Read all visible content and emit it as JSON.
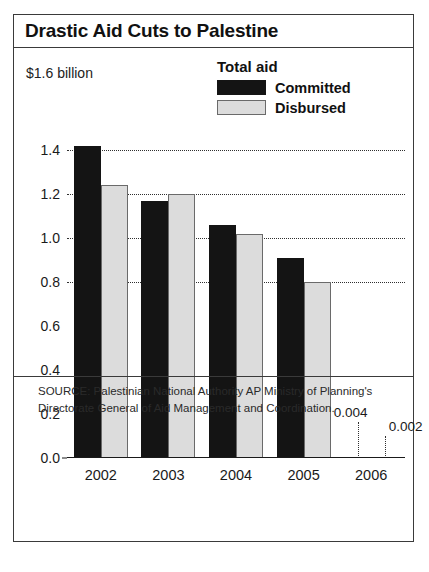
{
  "chart_title": "Drastic Aid Cuts to Palestine",
  "units_label": "$1.6 billion",
  "legend": {
    "title": "Total aid",
    "items": [
      {
        "label": "Committed",
        "swatch": "black-swatch-icon",
        "color": "#141414"
      },
      {
        "label": "Disbursed",
        "swatch": "gray-swatch-icon",
        "color": "#dcdcdc"
      }
    ]
  },
  "source": "SOURCE: Palestinian National Authority AP Ministry of Planning's Directorate General of Aid Management and Coordination.",
  "chart_data": {
    "type": "bar",
    "title": "Drastic Aid Cuts to Palestine",
    "subtitle": "Total aid",
    "xlabel": "",
    "ylabel": "$1.6 billion",
    "categories": [
      "2002",
      "2003",
      "2004",
      "2005",
      "2006"
    ],
    "series": [
      {
        "name": "Committed",
        "color": "#141414",
        "values": [
          1.42,
          1.17,
          1.06,
          0.91,
          0.004
        ]
      },
      {
        "name": "Disbursed",
        "color": "#dcdcdc",
        "values": [
          1.24,
          1.2,
          1.02,
          0.8,
          0.002
        ]
      }
    ],
    "ylim": [
      0.0,
      1.5
    ],
    "yticks": [
      0.0,
      0.2,
      0.4,
      0.6,
      0.8,
      1.0,
      1.2,
      1.4
    ],
    "ytick_labels": [
      "0.0",
      "0.2",
      "0.4",
      "0.6",
      "0.8",
      "1.0",
      "1.2",
      "1.4"
    ],
    "gridlines_at": [
      0.8,
      1.0,
      1.2,
      1.4
    ],
    "grid": true,
    "legend_position": "top-right",
    "annotations": [
      {
        "category": "2006",
        "series": "Committed",
        "text": "0.004"
      },
      {
        "category": "2006",
        "series": "Disbursed",
        "text": "0.002"
      }
    ]
  }
}
